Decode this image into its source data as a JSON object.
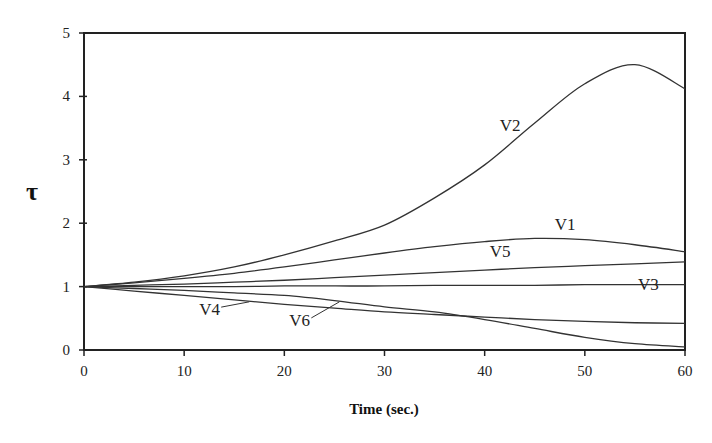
{
  "chart_data": {
    "type": "line",
    "title": "",
    "xlabel": "Time (sec.)",
    "ylabel": "τ",
    "xlim": [
      0,
      60
    ],
    "ylim": [
      0,
      5
    ],
    "xticks": [
      0,
      10,
      20,
      30,
      40,
      50,
      60
    ],
    "yticks": [
      0,
      1,
      2,
      3,
      4,
      5
    ],
    "grid": false,
    "legend": "inline labels",
    "x": [
      0,
      5,
      10,
      15,
      20,
      25,
      30,
      35,
      40,
      45,
      50,
      55,
      60
    ],
    "series": [
      {
        "name": "V1",
        "values": [
          1.0,
          1.06,
          1.13,
          1.21,
          1.31,
          1.42,
          1.53,
          1.63,
          1.71,
          1.76,
          1.74,
          1.66,
          1.55
        ]
      },
      {
        "name": "V2",
        "values": [
          1.0,
          1.07,
          1.17,
          1.31,
          1.5,
          1.72,
          1.97,
          2.4,
          2.92,
          3.58,
          4.2,
          4.5,
          4.12
        ]
      },
      {
        "name": "V3",
        "values": [
          1.0,
          1.0,
          1.0,
          1.0,
          1.01,
          1.01,
          1.01,
          1.02,
          1.02,
          1.02,
          1.03,
          1.03,
          1.03
        ]
      },
      {
        "name": "V4",
        "values": [
          1.0,
          0.93,
          0.86,
          0.79,
          0.72,
          0.66,
          0.6,
          0.56,
          0.52,
          0.48,
          0.45,
          0.43,
          0.42
        ]
      },
      {
        "name": "V5",
        "values": [
          1.0,
          1.02,
          1.04,
          1.07,
          1.1,
          1.14,
          1.18,
          1.22,
          1.26,
          1.3,
          1.33,
          1.36,
          1.39
        ]
      },
      {
        "name": "V6",
        "values": [
          1.0,
          0.97,
          0.94,
          0.9,
          0.86,
          0.78,
          0.68,
          0.6,
          0.48,
          0.34,
          0.2,
          0.1,
          0.05
        ]
      }
    ],
    "annotations": [
      {
        "text": "V1",
        "x": 47,
        "y": 1.9
      },
      {
        "text": "V2",
        "x": 41.5,
        "y": 3.45
      },
      {
        "text": "V3",
        "x": 55.3,
        "y": 0.95
      },
      {
        "text": "V4",
        "x": 11.5,
        "y": 0.55,
        "leader_to": [
          16.5,
          0.76
        ]
      },
      {
        "text": "V5",
        "x": 40.5,
        "y": 1.46
      },
      {
        "text": "V6",
        "x": 20.5,
        "y": 0.38,
        "leader_to": [
          25.5,
          0.76
        ]
      }
    ]
  },
  "labels": {
    "xlabel": "Time (sec.)",
    "ylabel": "τ",
    "xticks": [
      "0",
      "10",
      "20",
      "30",
      "40",
      "50",
      "60"
    ],
    "yticks": [
      "0",
      "1",
      "2",
      "3",
      "4",
      "5"
    ],
    "series": [
      "V1",
      "V2",
      "V3",
      "V4",
      "V5",
      "V6"
    ]
  },
  "colors": {
    "line": "#333333",
    "axis": "#222222",
    "background": "#ffffff"
  }
}
